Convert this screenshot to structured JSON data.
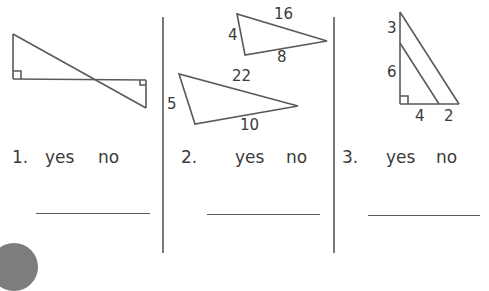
{
  "colors": {
    "line": "#5a5a5a",
    "text": "#3a3a3a",
    "divider": "#7a7a7a",
    "badge": "#7d7d7d"
  },
  "problems": [
    {
      "number": "1.",
      "yes": "yes",
      "no": "no",
      "figure": "two right triangles sharing a crossing diagonal (bowtie), right angles marked"
    },
    {
      "number": "2.",
      "yes": "yes",
      "no": "no",
      "figure": "two triangles",
      "triangle_a": {
        "side_top": "16",
        "side_left": "4",
        "side_bottom": "8"
      },
      "triangle_b": {
        "side_top": "22",
        "side_left": "5",
        "side_bottom": "10"
      }
    },
    {
      "number": "3.",
      "yes": "yes",
      "no": "no",
      "figure": "right triangle with parallel inner segment",
      "labels": {
        "upper_vertical": "3",
        "lower_vertical": "6",
        "base_left": "4",
        "base_right": "2"
      }
    }
  ]
}
